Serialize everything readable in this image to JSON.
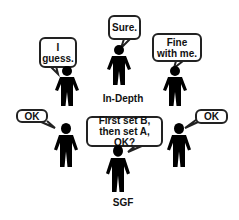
{
  "diagram": {
    "people": [
      {
        "id": "guess",
        "speech": "I\nguess."
      },
      {
        "id": "in-depth",
        "speech": "Sure.",
        "label": "In-Depth"
      },
      {
        "id": "fine",
        "speech": "Fine\nwith me."
      },
      {
        "id": "ok-left",
        "speech": "OK"
      },
      {
        "id": "sgf",
        "speech": "First set B,\nthen set A, OK?",
        "label": "SGF"
      },
      {
        "id": "ok-right",
        "speech": "OK"
      }
    ]
  },
  "colors": {
    "figure": "#000000",
    "bubble_border": "#222222",
    "background": "#ffffff"
  }
}
